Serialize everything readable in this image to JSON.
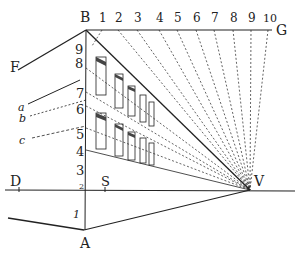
{
  "figure": {
    "points": {
      "B": "B",
      "G": "G",
      "F": "F",
      "D": "D",
      "S": "S",
      "V": "V",
      "A": "A"
    },
    "top_scale": [
      "1",
      "2",
      "3",
      "4",
      "5",
      "6",
      "7",
      "8",
      "9",
      "10"
    ],
    "vertical_scale": [
      "9",
      "8",
      "7",
      "6",
      "5",
      "4",
      "3",
      "2",
      "1"
    ],
    "side_labels": [
      "a",
      "b",
      "c"
    ],
    "colors": {
      "ink": "#222222",
      "background": "#ffffff"
    }
  }
}
